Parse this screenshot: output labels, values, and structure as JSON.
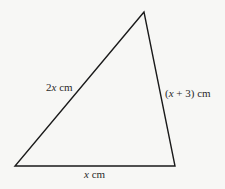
{
  "diagram": {
    "type": "triangle",
    "vertices": {
      "top": [
        144,
        12
      ],
      "bottom_left": [
        15,
        166
      ],
      "bottom_right": [
        175,
        166
      ]
    },
    "stroke_color": "#1a1a1a",
    "background": "#f7f7f5",
    "labels": {
      "left_side": {
        "coef": "2",
        "var": "x",
        "unit": " cm"
      },
      "right_side": {
        "open": "(",
        "var": "x",
        "rest": " + 3) cm"
      },
      "base": {
        "var": "x",
        "unit": " cm"
      }
    }
  }
}
